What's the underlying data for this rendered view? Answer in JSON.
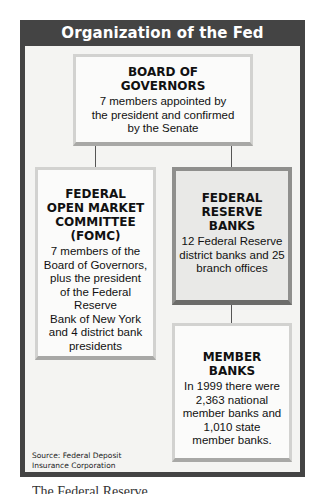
{
  "title": "Organization of the Fed",
  "boxes": {
    "board": {
      "heading_line1": "BOARD OF",
      "heading_line2": "GOVERNORS",
      "body_line1": "7 members appointed by",
      "body_line2": "the president and confirmed",
      "body_line3": "by the Senate"
    },
    "fomc": {
      "heading_line1": "FEDERAL",
      "heading_line2": "OPEN MARKET",
      "heading_line3": "COMMITTEE",
      "heading_line4": "(FOMC)",
      "body_line1": "7 members of the",
      "body_line2": "Board of Governors,",
      "body_line3": "plus the president",
      "body_line4": "of the Federal Reserve",
      "body_line5": "Bank of New York",
      "body_line6": "and 4 district bank",
      "body_line7": "presidents"
    },
    "reserve_banks": {
      "heading_line1": "FEDERAL",
      "heading_line2": "RESERVE",
      "heading_line3": "BANKS",
      "body_line1": "12 Federal Reserve",
      "body_line2": "district banks and 25",
      "body_line3": "branch offices"
    },
    "member_banks": {
      "heading_line1": "MEMBER",
      "heading_line2": "BANKS",
      "body_line1": "In 1999 there were",
      "body_line2": "2,363 national",
      "body_line3": "member banks and",
      "body_line4": "1,010 state",
      "body_line5": "member banks."
    }
  },
  "source_line1": "Source: Federal Deposit",
  "source_line2": "Insurance Corporation",
  "caption_partial": "The Federal Reserve",
  "colors": {
    "frame": "#444444",
    "inner_background": "#f4f4f2",
    "highlight_box_border": "#8f8f8d"
  }
}
